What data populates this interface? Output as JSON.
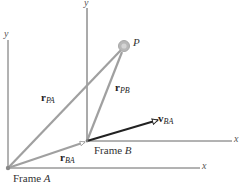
{
  "diagram": {
    "frame_a": {
      "label_text": "Frame",
      "label_letter": "A",
      "origin": [
        8,
        168
      ],
      "x_axis_label": "x",
      "y_axis_label": "y"
    },
    "frame_b": {
      "label_text": "Frame",
      "label_letter": "B",
      "origin": [
        87,
        141
      ],
      "x_axis_label": "x",
      "y_axis_label": "y"
    },
    "point": {
      "label": "P",
      "position": [
        124,
        46
      ]
    },
    "vectors": {
      "r_pa": {
        "symbol": "r",
        "subscript": "PA"
      },
      "r_pb": {
        "symbol": "r",
        "subscript": "PB"
      },
      "r_ba": {
        "symbol": "r",
        "subscript": "BA"
      },
      "v_ba": {
        "symbol": "v",
        "subscript": "BA"
      }
    },
    "colors": {
      "vector_gray": "#a0a0a0",
      "velocity_black": "#222222",
      "axis": "#555555",
      "point_fill": "#b8b8b8"
    }
  }
}
